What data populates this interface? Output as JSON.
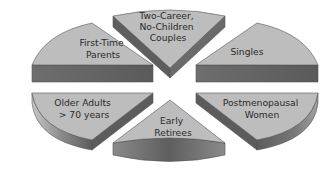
{
  "diagram": {
    "type": "exploded-3d-pie",
    "colors": {
      "top_face": "#bdbdbd",
      "side_face": "#666666",
      "outline": "#555555",
      "text": "#2a2a2a",
      "background": "#ffffff"
    },
    "segments": [
      {
        "id": "first-time-parents",
        "lines": [
          "First-Time",
          "Parents"
        ]
      },
      {
        "id": "two-career-no-children-couples",
        "lines": [
          "Two-Career,",
          "No-Children",
          "Couples"
        ]
      },
      {
        "id": "singles",
        "lines": [
          "Singles"
        ]
      },
      {
        "id": "older-adults",
        "lines": [
          "Older Adults",
          "> 70 years"
        ]
      },
      {
        "id": "early-retirees",
        "lines": [
          "Early",
          "Retirees"
        ]
      },
      {
        "id": "postmenopausal-women",
        "lines": [
          "Postmenopausal",
          "Women"
        ]
      }
    ]
  }
}
